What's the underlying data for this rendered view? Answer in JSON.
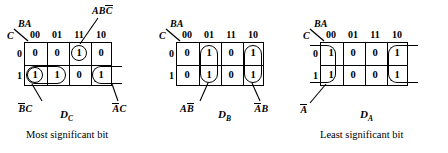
{
  "figure": {
    "type": "karnaugh-maps",
    "count": 3
  },
  "kmaps": [
    {
      "id": "dc",
      "function_label": "D",
      "function_sub": "C",
      "caption": "Most significant bit",
      "corner_top_label": "BA",
      "corner_side_label": "C",
      "col_headers": [
        "00",
        "01",
        "11",
        "10"
      ],
      "row_headers": [
        "0",
        "1"
      ],
      "values": [
        [
          "0",
          "0",
          "1",
          "0"
        ],
        [
          "1",
          "1",
          "0",
          "1"
        ]
      ],
      "annotations": [
        {
          "name": "abcbar",
          "text_a": "AB",
          "text_over": "C",
          "position": "top"
        },
        {
          "name": "bbarc",
          "text_over": "B",
          "text_b": "C",
          "position": "bottom-left"
        },
        {
          "name": "abarc",
          "text_over": "A",
          "text_b": "C",
          "position": "bottom-right"
        }
      ]
    },
    {
      "id": "db",
      "function_label": "D",
      "function_sub": "B",
      "caption": "",
      "corner_top_label": "BA",
      "corner_side_label": "C",
      "col_headers": [
        "00",
        "01",
        "11",
        "10"
      ],
      "row_headers": [
        "0",
        "1"
      ],
      "values": [
        [
          "0",
          "1",
          "0",
          "1"
        ],
        [
          "0",
          "1",
          "0",
          "1"
        ]
      ],
      "annotations": [
        {
          "name": "abbar",
          "text_a": "A",
          "text_over": "B",
          "position": "bottom-left"
        },
        {
          "name": "abarb",
          "text_over": "A",
          "text_b": "B",
          "position": "bottom-right"
        }
      ]
    },
    {
      "id": "da",
      "function_label": "D",
      "function_sub": "A",
      "caption": "Least significant bit",
      "corner_top_label": "BA",
      "corner_side_label": "C",
      "col_headers": [
        "00",
        "01",
        "11",
        "10"
      ],
      "row_headers": [
        "0",
        "1"
      ],
      "values": [
        [
          "1",
          "0",
          "0",
          "1"
        ],
        [
          "1",
          "0",
          "0",
          "1"
        ]
      ],
      "annotations": [
        {
          "name": "abar",
          "text_over": "A",
          "text_b": "",
          "position": "bottom-left"
        }
      ]
    }
  ],
  "colors": {
    "ink": "#000000",
    "paper": "#ffffff"
  }
}
